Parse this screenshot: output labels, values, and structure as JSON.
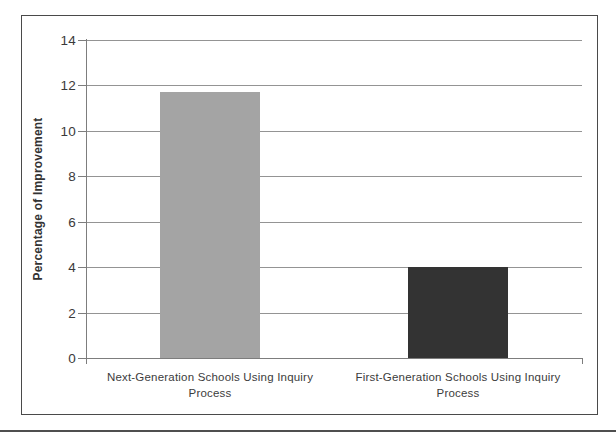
{
  "chart_data": {
    "type": "bar",
    "title": "",
    "xlabel": "",
    "ylabel": "Percentage of Improvement",
    "categories": [
      "Next-Generation Schools Using Inquiry Process",
      "First-Generation Schools Using Inquiry Process"
    ],
    "values": [
      11.7,
      4.0
    ],
    "bar_colors": [
      "#a4a4a4",
      "#333333"
    ],
    "ylim": [
      0,
      14
    ],
    "ytick_step": 2,
    "ytick_labels": [
      "0",
      "2",
      "4",
      "6",
      "8",
      "10",
      "12",
      "14"
    ],
    "grid": true,
    "legend": false,
    "colors": {
      "gridline": "#949494",
      "axis": "#7d7d7d",
      "frame_border": "#4a4a4a",
      "text": "#3c3c3c",
      "background": "#ffffff"
    }
  }
}
